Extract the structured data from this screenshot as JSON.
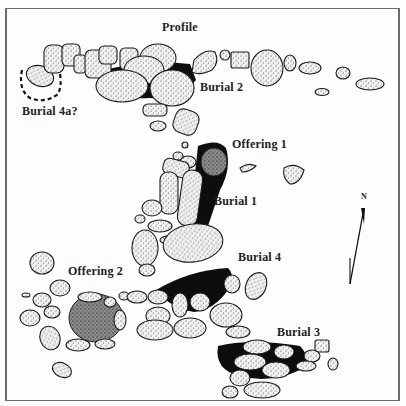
{
  "figure": {
    "type": "archaeological site plan",
    "frame_color": "#6b6b6b",
    "stone_fill": "#ebebeb",
    "stone_stroke": "#1a1a1a",
    "burial_fill": "#0d0d0d",
    "offering_fill": "#6e6e6e"
  },
  "labels": {
    "profile": "Profile",
    "burial_2": "Burial  2",
    "burial_4a": "Burial 4a?",
    "offering_1": "Offering 1",
    "burial_1": "Burial  1",
    "offering_2": "Offering 2",
    "burial_4": "Burial  4",
    "burial_3": "Burial  3"
  },
  "north_arrow": {
    "label": "N"
  }
}
